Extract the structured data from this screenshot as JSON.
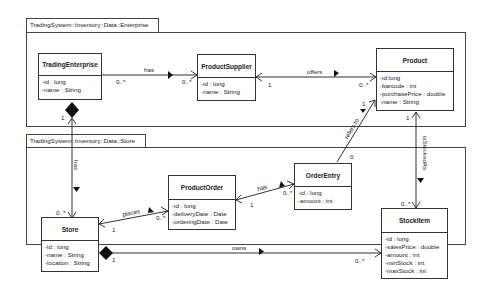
{
  "packages": [
    {
      "id": "enterprise",
      "title": "TradingSystem::Inventory::Data::Enterprise"
    },
    {
      "id": "store",
      "title": "TradingSystem::Inventory::Data::Store"
    }
  ],
  "classes": {
    "trading_enterprise": {
      "name": "TradingEnterprise",
      "attrs": [
        "-id : long",
        "-name : String"
      ]
    },
    "product_supplier": {
      "name": "ProductSupplier",
      "attrs": [
        "-id : long",
        "-name : String"
      ]
    },
    "product": {
      "name": "Product",
      "attrs": [
        "-id:long",
        "-barcode : int",
        "-purchasePrice : double",
        "-name : String"
      ]
    },
    "product_order": {
      "name": "ProductOrder",
      "attrs": [
        "-id : long",
        "-deliveryDate : Date",
        "-orderingDate : Date"
      ]
    },
    "order_entry": {
      "name": "OrderEntry",
      "attrs": [
        "-id : long",
        "-amount : int"
      ]
    },
    "store": {
      "name": "Store",
      "attrs": [
        "-id : long",
        "-name : String",
        "-location : String"
      ]
    },
    "stock_item": {
      "name": "StockItem",
      "attrs": [
        "-id : long",
        "-salesPrice : double",
        "-amount : int",
        "-minStock : int",
        "-maxStock : int"
      ]
    }
  },
  "associations": {
    "te_has_ps": {
      "label": "has",
      "mult_src": "0..*",
      "mult_dst": "0..*"
    },
    "ps_offers_p": {
      "label": "offers",
      "mult_src": "1",
      "mult_dst": "0..*"
    },
    "te_has_store": {
      "label": "has",
      "mult_src": "1",
      "mult_dst": "0..*"
    },
    "store_places_po": {
      "label": "places",
      "mult_src": "1",
      "mult_dst": "0..*"
    },
    "po_has_oe": {
      "label": "has",
      "mult_src": "1",
      "mult_dst": "0..*"
    },
    "oe_refers_p": {
      "label": "refers to",
      "mult_src": "0",
      "mult_dst": "1"
    },
    "p_stocked_si": {
      "label": "isStockedAs",
      "mult_src": "1",
      "mult_dst": "0..*"
    },
    "store_owns_si": {
      "label": "owns",
      "mult_src": "1",
      "mult_dst": "0..*"
    }
  }
}
